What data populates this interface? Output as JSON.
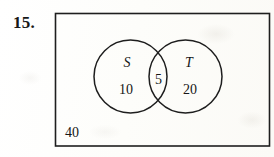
{
  "problem": {
    "number_label": "15.",
    "type": "venn-diagram",
    "description": "Two-set Venn diagram inside a rectangular universal set"
  },
  "diagram": {
    "universal_set": {
      "outside_count": "40"
    },
    "sets": [
      {
        "name": "S",
        "only_count": "10",
        "position": "left"
      },
      {
        "name": "T",
        "only_count": "20",
        "position": "right"
      }
    ],
    "intersection": {
      "count": "5"
    }
  },
  "style": {
    "ink_color": "#1e1e1e",
    "paper_color": "#fdfdfb",
    "text_color": "#161616"
  }
}
